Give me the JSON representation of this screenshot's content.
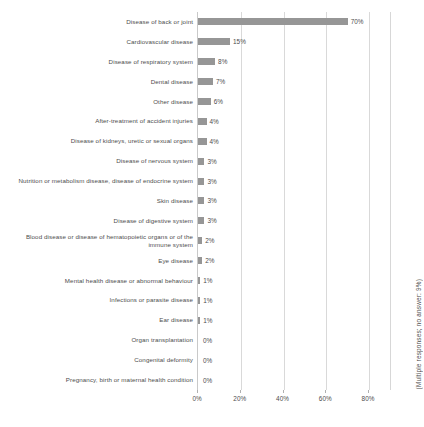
{
  "chart_data": {
    "type": "bar",
    "orientation": "horizontal",
    "title": "",
    "subtitle": "",
    "xlabel": "",
    "ylabel": "",
    "xlim": [
      0,
      80
    ],
    "xticks": [
      0,
      20,
      40,
      60,
      80
    ],
    "xtick_labels": [
      "0%",
      "20%",
      "40%",
      "60%",
      "80%"
    ],
    "grid": true,
    "legend": false,
    "bar_color": "#969696",
    "categories": [
      "Disease of back or joint",
      "Cardiovascular disease",
      "Disease of respiratory system",
      "Dental disease",
      "Other disease",
      "After-treatment of accident injuries",
      "Disease of kidneys, uretic or sexual organs",
      "Disease of nervous system",
      "Nutrition or metabolism disease, disease of endocrine system",
      "Skin disease",
      "Disease of digestive system",
      "Blood disease or disease of hematopoietic organs or of the immune system",
      "Eye disease",
      "Mental health disease or abnormal behaviour",
      "Infections or parasite disease",
      "Ear disease",
      "Organ transplantation",
      "Congenital deformity",
      "Pregnancy, birth or maternal health condition"
    ],
    "values": [
      70,
      15,
      8,
      7,
      6,
      4,
      4,
      3,
      3,
      3,
      3,
      2,
      2,
      1,
      1,
      1,
      0,
      0,
      0
    ],
    "value_labels": [
      "70%",
      "15%",
      "8%",
      "7%",
      "6%",
      "4%",
      "4%",
      "3%",
      "3%",
      "3%",
      "3%",
      "2%",
      "2%",
      "1%",
      "1%",
      "1%",
      "0%",
      "0%",
      "0%"
    ],
    "annotations": [
      "(Multiple responses; no answer: 9%)"
    ]
  },
  "note": {
    "text": "(Multiple responses; no answer: 9%)"
  }
}
